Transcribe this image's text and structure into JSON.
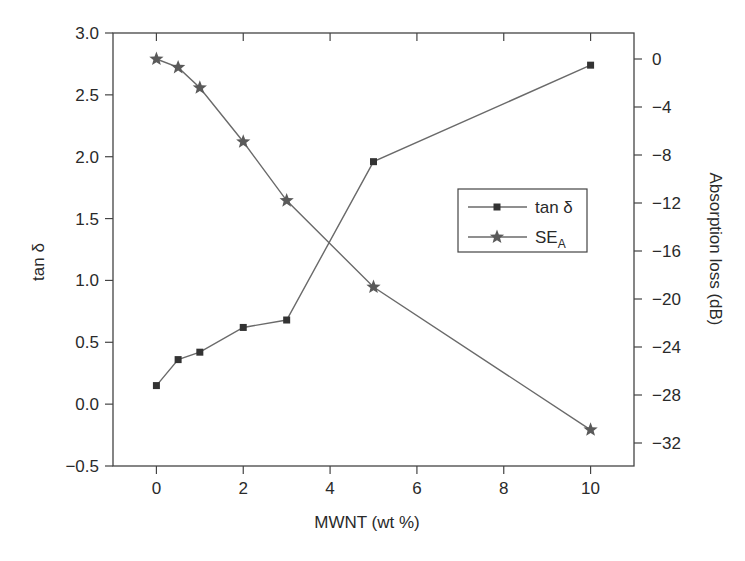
{
  "chart_data": {
    "type": "line",
    "title": "",
    "xlabel": "MWNT (wt %)",
    "ylabel": "tan δ",
    "y2label": "Absorption loss (dB)",
    "xlim": [
      -1,
      11
    ],
    "ylim": [
      -0.5,
      3.0
    ],
    "y2lim": [
      -34.3,
      2.1
    ],
    "xticks": [
      0,
      2,
      4,
      6,
      8,
      10
    ],
    "xtick_labels": [
      "0",
      "2",
      "4",
      "6",
      "8",
      "10"
    ],
    "yticks": [
      -0.5,
      0.0,
      0.5,
      1.0,
      1.5,
      2.0,
      2.5,
      3.0
    ],
    "ytick_labels": [
      "−0.5",
      "0.0",
      "0.5",
      "1.0",
      "1.5",
      "2.0",
      "2.5",
      "3.0"
    ],
    "y2ticks": [
      0,
      -4,
      -8,
      -12,
      -16,
      -20,
      -24,
      -28,
      -32
    ],
    "y2tick_labels": [
      "0",
      "−4",
      "−8",
      "−12",
      "−16",
      "−20",
      "−24",
      "−28",
      "−32"
    ],
    "grid": false,
    "legend_position": "center-right",
    "x": [
      0,
      0.5,
      1,
      2,
      3,
      5,
      10
    ],
    "series": [
      {
        "name": "tan δ",
        "axis": "left",
        "marker": "square",
        "values": [
          0.15,
          0.36,
          0.42,
          0.62,
          0.68,
          1.96,
          2.74
        ]
      },
      {
        "name": "SE_A",
        "axis": "right",
        "marker": "star",
        "values": [
          0.0,
          -0.7,
          -2.4,
          -6.9,
          -11.8,
          -19.0,
          -30.9
        ]
      }
    ]
  },
  "legend": {
    "tan_label": "tan δ",
    "se_label": "SE",
    "se_sub": "A"
  },
  "axes": {
    "x_title": "MWNT (wt %)",
    "y_title": "tan δ",
    "y2_title": "Absorption loss (dB)"
  },
  "colors": {
    "axis": "#444444",
    "line": "#6a6a6a",
    "square_marker": "#333333",
    "star_marker": "#5a5a5a"
  }
}
